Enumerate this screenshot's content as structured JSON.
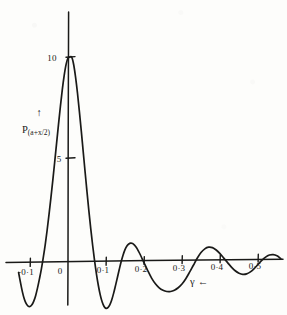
{
  "figure": {
    "kind": "hand-drawn-plot",
    "ink_color": "#1a1a18",
    "paper_color": "#fdfdfb"
  },
  "labels": {
    "y_axis_label_main": "P",
    "y_axis_label_args": "(a+x/2)",
    "y_axis_arrow": "↑",
    "x_axis_label_symbol": "γ",
    "x_axis_label_arrow": "←"
  },
  "chart_data": {
    "type": "line",
    "title": "",
    "xlabel": "γ",
    "ylabel": "P(a+x/2)",
    "grid": false,
    "legend": null,
    "xlim": [
      -0.13,
      0.57
    ],
    "ylim": [
      -3.0,
      10.6
    ],
    "xticks": [
      -0.1,
      0,
      0.1,
      0.2,
      0.3,
      0.4,
      0.5
    ],
    "xticklabels": [
      "-0·1",
      "0",
      "0·1",
      "0·2",
      "0·3",
      "0·4",
      "0·5"
    ],
    "yticks": [
      5,
      10
    ],
    "yticklabels": [
      "5",
      "10"
    ],
    "x": [
      -0.13,
      -0.125,
      -0.12,
      -0.115,
      -0.11,
      -0.105,
      -0.1,
      -0.095,
      -0.09,
      -0.085,
      -0.08,
      -0.075,
      -0.07,
      -0.065,
      -0.06,
      -0.055,
      -0.05,
      -0.045,
      -0.04,
      -0.035,
      -0.03,
      -0.025,
      -0.02,
      -0.015,
      -0.01,
      -0.005,
      0.0,
      0.005,
      0.01,
      0.015,
      0.02,
      0.025,
      0.03,
      0.035,
      0.04,
      0.045,
      0.05,
      0.055,
      0.06,
      0.065,
      0.07,
      0.075,
      0.08,
      0.085,
      0.09,
      0.095,
      0.1,
      0.105,
      0.11,
      0.115,
      0.12,
      0.125,
      0.13,
      0.135,
      0.14,
      0.145,
      0.15,
      0.155,
      0.16,
      0.165,
      0.17,
      0.175,
      0.18,
      0.185,
      0.19,
      0.195,
      0.2,
      0.21,
      0.22,
      0.23,
      0.24,
      0.25,
      0.26,
      0.27,
      0.28,
      0.29,
      0.3,
      0.31,
      0.32,
      0.33,
      0.34,
      0.35,
      0.36,
      0.37,
      0.38,
      0.39,
      0.4,
      0.41,
      0.42,
      0.43,
      0.44,
      0.45,
      0.46,
      0.47,
      0.48,
      0.49,
      0.5,
      0.51,
      0.52,
      0.53,
      0.54,
      0.55,
      0.56
    ],
    "y": [
      -0.55,
      -1.05,
      -1.5,
      -1.85,
      -2.08,
      -2.2,
      -2.22,
      -2.14,
      -1.96,
      -1.68,
      -1.3,
      -0.86,
      -0.38,
      0.18,
      0.8,
      1.5,
      2.28,
      3.1,
      3.96,
      4.86,
      5.78,
      6.7,
      7.58,
      8.4,
      9.1,
      9.64,
      9.94,
      10.0,
      9.98,
      9.62,
      9.0,
      8.22,
      7.32,
      6.36,
      5.36,
      4.36,
      3.38,
      2.44,
      1.56,
      0.74,
      0.0,
      -0.66,
      -1.22,
      -1.68,
      -2.02,
      -2.24,
      -2.33,
      -2.3,
      -2.16,
      -1.92,
      -1.6,
      -1.22,
      -0.82,
      -0.42,
      -0.04,
      0.28,
      0.54,
      0.72,
      0.82,
      0.86,
      0.84,
      0.76,
      0.64,
      0.48,
      0.3,
      0.1,
      -0.1,
      -0.5,
      -0.86,
      -1.14,
      -1.34,
      -1.46,
      -1.52,
      -1.52,
      -1.46,
      -1.34,
      -1.16,
      -0.9,
      -0.58,
      -0.24,
      0.1,
      0.38,
      0.56,
      0.64,
      0.62,
      0.5,
      0.32,
      0.1,
      -0.12,
      -0.34,
      -0.52,
      -0.64,
      -0.7,
      -0.68,
      -0.58,
      -0.42,
      -0.22,
      -0.02,
      0.14,
      0.24,
      0.26,
      0.2,
      0.06,
      -0.12,
      -0.3,
      -0.44
    ]
  },
  "geometry": {
    "origin_px": {
      "x": 68,
      "y": 261
    },
    "px_per_x_unit": 380,
    "px_per_y_unit": 20.4,
    "y_axis_top_px": 12,
    "y_axis_bottom_px": 305,
    "x_axis_left_px": 6,
    "x_axis_right_px": 283
  }
}
